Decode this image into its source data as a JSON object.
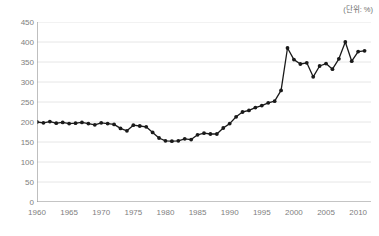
{
  "unit_note": "(단위: %)",
  "chart_data": {
    "type": "line",
    "title": "",
    "subtitle": "",
    "xlabel": "",
    "ylabel": "",
    "unit": "%",
    "unit_note": "(단위: %)",
    "grid": true,
    "grid_axis": "y",
    "legend": "none",
    "marker": "circle",
    "line_color": "#1a1a1a",
    "grid_color": "#e6e6e6",
    "axis_color": "#888888",
    "tick_label_color": "#808080",
    "xlim": [
      1960,
      2012
    ],
    "ylim": [
      0,
      450
    ],
    "yticks": [
      0,
      50,
      100,
      150,
      200,
      250,
      300,
      350,
      400,
      450
    ],
    "ytick_labels": [
      "0",
      "50",
      "100",
      "150",
      "200",
      "250",
      "300",
      "350",
      "400",
      "450"
    ],
    "xticks": [
      1960,
      1965,
      1970,
      1975,
      1980,
      1985,
      1990,
      1995,
      2000,
      2005,
      2010
    ],
    "xtick_labels": [
      "1960",
      "1965",
      "1970",
      "1975",
      "1980",
      "1985",
      "1990",
      "1995",
      "2000",
      "2005",
      "2010"
    ],
    "x": [
      1960,
      1961,
      1962,
      1963,
      1964,
      1965,
      1966,
      1967,
      1968,
      1969,
      1970,
      1971,
      1972,
      1973,
      1974,
      1975,
      1976,
      1977,
      1978,
      1979,
      1980,
      1981,
      1982,
      1983,
      1984,
      1985,
      1986,
      1987,
      1988,
      1989,
      1990,
      1991,
      1992,
      1993,
      1994,
      1995,
      1996,
      1997,
      1998,
      1999,
      2000,
      2001,
      2002,
      2003,
      2004,
      2005,
      2006,
      2007,
      2008,
      2009,
      2010,
      2011
    ],
    "values": [
      200,
      198,
      201,
      197,
      199,
      196,
      197,
      199,
      196,
      193,
      198,
      196,
      194,
      184,
      178,
      192,
      190,
      188,
      174,
      160,
      153,
      152,
      153,
      158,
      156,
      168,
      172,
      170,
      170,
      185,
      196,
      213,
      225,
      229,
      236,
      241,
      248,
      252,
      279,
      385,
      356,
      345,
      348,
      313,
      340,
      346,
      332,
      358,
      400,
      352,
      376,
      378
    ],
    "series": [
      {
        "name": "비율",
        "values": [
          200,
          198,
          201,
          197,
          199,
          196,
          197,
          199,
          196,
          193,
          198,
          196,
          194,
          184,
          178,
          192,
          190,
          188,
          174,
          160,
          153,
          152,
          153,
          158,
          156,
          168,
          172,
          170,
          170,
          185,
          196,
          213,
          225,
          229,
          236,
          241,
          248,
          252,
          279,
          385,
          356,
          345,
          348,
          313,
          340,
          346,
          332,
          358,
          400,
          352,
          376,
          378
        ]
      }
    ]
  }
}
